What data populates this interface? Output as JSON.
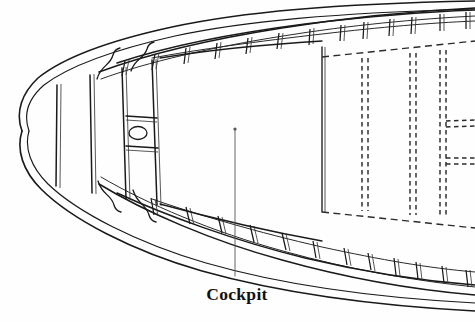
{
  "drawing": {
    "title": "Boat Deck Framing Plan",
    "view": "plan view",
    "background_color": "#fefefe",
    "line_color": "#1a1a1a",
    "hidden_line_color": "#2b2b2b",
    "width_px": 475,
    "height_px": 322
  },
  "labels": {
    "cockpit": "Cockpit"
  },
  "annotations": {
    "cockpit_leader": {
      "label": "Cockpit",
      "label_x": 243,
      "label_y": 295,
      "point_x": 235,
      "point_y": 128,
      "line_from_x": 235,
      "line_from_y": 276,
      "line_to_x": 235,
      "line_to_y": 129
    }
  },
  "geometry": {
    "hull_outer": "M 21 130 C 14 113 19 94 35 78 C 60 58 110 40 170 27 C 240 12 330 5 475 2",
    "hull_outer_bottom": "M 21 130 C 14 148 20 170 38 188 C 68 218 130 250 200 270 C 275 291 360 304 475 310",
    "hull_inner": "M 27 130 C 21 115 26 99 41 85 C 66 66 114 48 173 35 C 243 20 332 13 475 10",
    "hull_inner_bottom": "M 27 130 C 22 146 28 166 45 183 C 74 211 134 242 203 262 C 277 283 361 296 475 302",
    "sheer_outer": "M 96 183 C 140 210 205 240 272 259 C 340 278 410 289 475 294",
    "sheer_outer_top": "M 96 73 C 140 56 205 40 272 29 C 340 18 412 12 475 9",
    "sheer_inner_top": "M 97 80 C 142 64 206 49 273 38 C 341 27 412 21 475 18",
    "sheer_inner_bottom": "M 97 176 C 142 203 206 232 273 251 C 341 270 412 281 475 286",
    "deck_edge_top": "M 112 69 C 160 52 230 37 300 28 C 368 19 420 15 475 13",
    "deck_edge_bottom": "M 112 187 C 160 210 230 238 300 255 C 368 271 420 279 475 284",
    "inner_sheer_fwd_top": "M 128 59 C 175 44 245 31 315 24",
    "cockpit_boundary": "M 160 66 C 215 56 275 50 322 48 L 322 213 C 275 211 215 205 160 195"
  },
  "frames": {
    "count_top": 14,
    "count_bottom": 13,
    "note": "vertical deck beams between outer and inner sheer rails"
  },
  "aft_hidden_structure": {
    "description": "dashed hidden outlines of aft seats and lockers",
    "vertical_lines_x": [
      363,
      368,
      411,
      416,
      441,
      446
    ],
    "top_y": 58,
    "bottom_y": 211,
    "cross_dash_y": [
      121,
      158
    ]
  },
  "forward_compartment": {
    "bulkhead_x": [
      88,
      113,
      137,
      160
    ],
    "mast_partner": {
      "cx": 137,
      "cy": 133,
      "rx": 9,
      "ry": 6.5
    }
  },
  "colors": {
    "stroke": "#1a1a1a",
    "hidden": "#2b2b2b",
    "leader": "#555555",
    "label": "#111111",
    "background": "#fefefe"
  }
}
